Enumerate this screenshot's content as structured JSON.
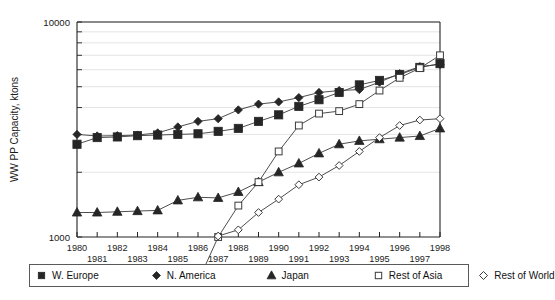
{
  "chart_data": {
    "type": "line",
    "title": "",
    "xlabel": "",
    "ylabel": "WW PP Capacity, ktons",
    "yscale": "log",
    "ylim": [
      1000,
      10000
    ],
    "ytick_labels": [
      "10000",
      "1000"
    ],
    "grid": true,
    "legend_position": "bottom",
    "x": [
      1980,
      1981,
      1982,
      1983,
      1984,
      1985,
      1986,
      1987,
      1988,
      1989,
      1990,
      1991,
      1992,
      1993,
      1994,
      1995,
      1996,
      1997,
      1998
    ],
    "xtick_labels_upper": [
      "1980",
      "1982",
      "1984",
      "1986",
      "1988",
      "1990",
      "1992",
      "1994",
      "1996",
      "1998"
    ],
    "xtick_labels_lower": [
      "1981",
      "1983",
      "1985",
      "1987",
      "1989",
      "1991",
      "1993",
      "1995",
      "1997"
    ],
    "series": [
      {
        "name": "W. Europe",
        "marker": "filled-square",
        "values": [
          2700,
          2900,
          2920,
          2960,
          2980,
          3000,
          3020,
          3100,
          3200,
          3450,
          3700,
          4050,
          4350,
          4700,
          5100,
          5350,
          5700,
          6150,
          6400
        ]
      },
      {
        "name": "N. America",
        "marker": "filled-diamond",
        "values": [
          3000,
          2950,
          2960,
          2980,
          3050,
          3250,
          3450,
          3550,
          3900,
          4150,
          4250,
          4450,
          4700,
          4800,
          4850,
          5250,
          5750,
          6200,
          6350
        ]
      },
      {
        "name": "Japan",
        "marker": "filled-triangle",
        "values": [
          1300,
          1300,
          1310,
          1320,
          1330,
          1480,
          1530,
          1520,
          1620,
          1800,
          2000,
          2200,
          2450,
          2700,
          2800,
          2850,
          2900,
          2950,
          3200
        ]
      },
      {
        "name": "Rest of Asia",
        "marker": "open-square",
        "values": [
          null,
          null,
          null,
          null,
          null,
          null,
          620,
          1000,
          1400,
          1800,
          2500,
          3300,
          3750,
          3850,
          4150,
          4800,
          5500,
          6100,
          7000
        ]
      },
      {
        "name": "Rest of World",
        "marker": "open-diamond",
        "values": [
          null,
          null,
          null,
          null,
          null,
          null,
          null,
          1010,
          1080,
          1300,
          1500,
          1750,
          1900,
          2150,
          2500,
          2900,
          3300,
          3500,
          3550
        ]
      }
    ]
  },
  "legend": {
    "items": [
      {
        "label": "W. Europe",
        "marker": "filled-square"
      },
      {
        "label": "N. America",
        "marker": "filled-diamond"
      },
      {
        "label": "Japan",
        "marker": "filled-triangle"
      },
      {
        "label": "Rest of Asia",
        "marker": "open-square"
      },
      {
        "label": "Rest of World",
        "marker": "open-diamond"
      }
    ]
  }
}
